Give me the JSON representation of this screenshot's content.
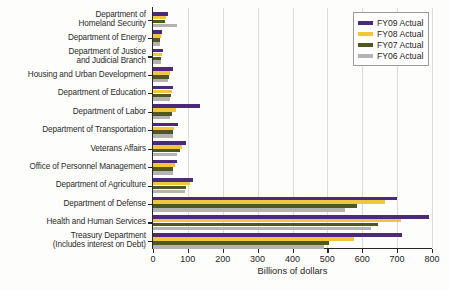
{
  "chart_data": {
    "type": "bar",
    "orientation": "horizontal",
    "title": "",
    "xlabel": "Billions of dollars",
    "ylabel": "",
    "xlim": [
      0,
      800
    ],
    "xticks": [
      0,
      100,
      200,
      300,
      400,
      500,
      600,
      700,
      800
    ],
    "grid": true,
    "grid_axis": "x",
    "legend_position": "top-right",
    "categories": [
      "Department of\nHomeland Security",
      "Department of Energy",
      "Department of Justice\nand Judicial Branch",
      "Housing and Urban Development",
      "Department of Education",
      "Department of Labor",
      "Department of Transportation",
      "Veterans Affairs",
      "Office of Personnel Management",
      "Department of Agriculture",
      "Department of Defense",
      "Health and Human Services",
      "Treasury Department\n(Includes interest on Debt)"
    ],
    "series": [
      {
        "name": "FY09 Actual",
        "color": "#4b2a7b",
        "values": [
          42,
          27,
          30,
          56,
          58,
          135,
          72,
          95,
          70,
          115,
          700,
          790,
          715
        ]
      },
      {
        "name": "FY08 Actual",
        "color": "#f2c53d",
        "values": [
          38,
          22,
          26,
          48,
          54,
          65,
          60,
          84,
          62,
          105,
          665,
          710,
          575
        ]
      },
      {
        "name": "FY07 Actual",
        "color": "#4e5820",
        "values": [
          34,
          20,
          24,
          46,
          52,
          55,
          58,
          76,
          58,
          96,
          585,
          645,
          505
        ]
      },
      {
        "name": "FY06 Actual",
        "color": "#b3b3b3",
        "values": [
          68,
          19,
          23,
          44,
          50,
          48,
          56,
          70,
          56,
          92,
          550,
          625,
          490
        ]
      }
    ]
  },
  "legend": {
    "items": [
      {
        "label": "FY09 Actual"
      },
      {
        "label": "FY08 Actual"
      },
      {
        "label": "FY07 Actual"
      },
      {
        "label": "FY06 Actual"
      }
    ]
  }
}
